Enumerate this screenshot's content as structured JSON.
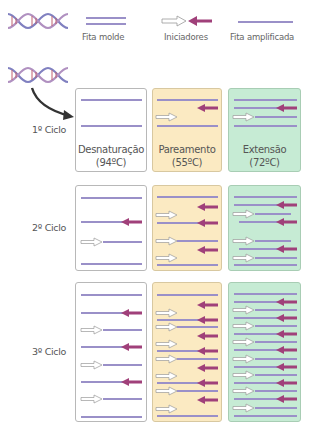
{
  "legend": {
    "template_strand": "Fita molde",
    "primers": "Iniciadores",
    "amplified_strand": "Fita amplificada"
  },
  "colors": {
    "strand": "#9a90c8",
    "primer_reverse": "#a0407a",
    "primer_forward_fill": "#ffffff",
    "primer_forward_stroke": "#999999",
    "helix_blue": "#8080c0",
    "helix_red": "#c06070",
    "box_white": "#ffffff",
    "box_yellow": "#fbeac2",
    "box_green": "#c6ebd4"
  },
  "steps": [
    {
      "name": "Desnaturação",
      "temp": "(94ºC)"
    },
    {
      "name": "Pareamento",
      "temp": "(55ºC)"
    },
    {
      "name": "Extensão",
      "temp": "(72ºC)"
    }
  ],
  "cycles": [
    {
      "label": "1º Ciclo"
    },
    {
      "label": "2º Ciclo"
    },
    {
      "label": "3º Ciclo"
    }
  ]
}
